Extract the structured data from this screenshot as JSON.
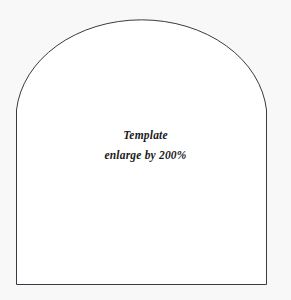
{
  "page": {
    "background_color": "#f8f8f8",
    "width": 291,
    "height": 300
  },
  "template_shape": {
    "name": "arch-outline",
    "description": "Arch (rounded-top, flat-bottom) template outline",
    "fill_color": "#ffffff",
    "stroke_color": "#3a3a42",
    "stroke_width": 1,
    "left_x": 16,
    "right_x": 267,
    "bottom_y": 284,
    "arc_apex_y": 11,
    "arc_spring_y": 110
  },
  "caption": {
    "title": "Template",
    "instruction": "enlarge by 200%",
    "text_color": "#1a1a1a",
    "style": "italic-bold-serif"
  }
}
